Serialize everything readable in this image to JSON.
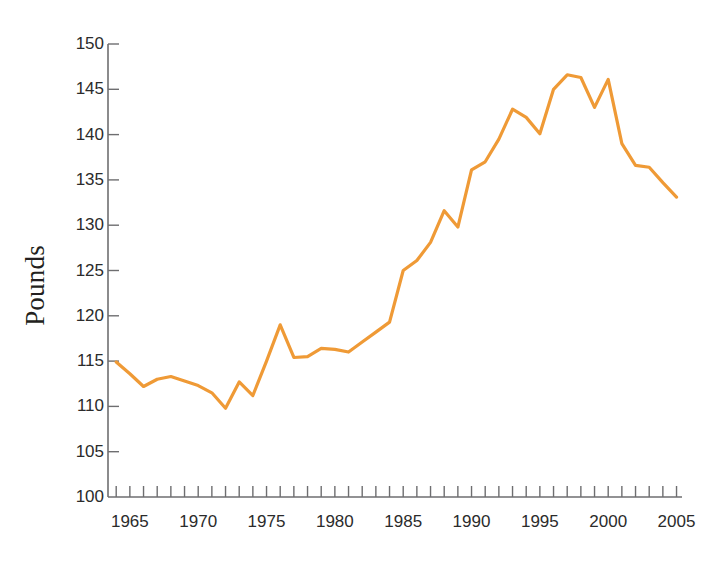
{
  "chart_data": {
    "type": "line",
    "title": "",
    "subtitle": "",
    "xlabel": "",
    "ylabel": "Pounds",
    "xlim": [
      1963.4,
      2005.4
    ],
    "ylim": [
      100,
      150
    ],
    "yticks": [
      100,
      105,
      110,
      115,
      120,
      125,
      130,
      135,
      140,
      145,
      150
    ],
    "ytick_labels": [
      "100",
      "105",
      "110",
      "115",
      "120",
      "125",
      "130",
      "135",
      "140",
      "145",
      "150"
    ],
    "xticks": [
      1964,
      1965,
      1966,
      1967,
      1968,
      1969,
      1970,
      1971,
      1972,
      1973,
      1974,
      1975,
      1976,
      1977,
      1978,
      1979,
      1980,
      1981,
      1982,
      1983,
      1984,
      1985,
      1986,
      1987,
      1988,
      1989,
      1990,
      1991,
      1992,
      1993,
      1994,
      1995,
      1996,
      1997,
      1998,
      1999,
      2000,
      2001,
      2002,
      2003,
      2004,
      2005
    ],
    "xtick_labels_shown": [
      "1965",
      "1970",
      "1975",
      "1980",
      "1985",
      "1990",
      "1995",
      "2000",
      "2005"
    ],
    "xtick_labels_shown_at": [
      1965,
      1970,
      1975,
      1980,
      1985,
      1990,
      1995,
      2000,
      2005
    ],
    "grid": false,
    "legend": false,
    "legend_position": "none",
    "line_color": "#ef9a36",
    "axis_color": "#6e6e70",
    "text_color": "#2b2b2b",
    "background": "#ffffff",
    "series": [
      {
        "name": "Pounds",
        "color": "#ef9a36",
        "x": [
          1964,
          1965,
          1966,
          1967,
          1968,
          1969,
          1970,
          1971,
          1972,
          1973,
          1974,
          1975,
          1976,
          1977,
          1978,
          1979,
          1980,
          1981,
          1982,
          1983,
          1984,
          1985,
          1986,
          1987,
          1988,
          1989,
          1990,
          1991,
          1992,
          1993,
          1994,
          1995,
          1996,
          1997,
          1998,
          1999,
          2000,
          2001,
          2002,
          2003,
          2004,
          2005
        ],
        "values": [
          114.9,
          113.6,
          112.2,
          113.0,
          113.3,
          112.8,
          112.3,
          111.5,
          109.8,
          112.7,
          111.2,
          115.0,
          119.0,
          115.4,
          115.5,
          116.4,
          116.3,
          116.0,
          117.1,
          118.2,
          119.3,
          125.0,
          126.1,
          128.1,
          131.6,
          129.8,
          136.1,
          137.0,
          139.5,
          142.8,
          141.9,
          140.1,
          145.0,
          146.6,
          146.3,
          143.0,
          146.1,
          139.0,
          136.6,
          136.4,
          134.7,
          133.1
        ]
      }
    ]
  }
}
